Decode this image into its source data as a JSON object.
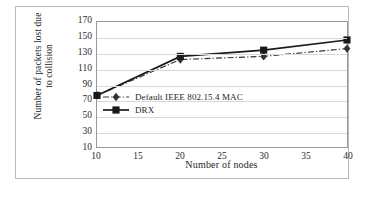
{
  "chart_data": {
    "type": "line",
    "title": "",
    "xlabel": "Number of nodes",
    "ylabel": "Number of packets lost due\nto collision",
    "x": [
      10,
      20,
      30,
      40
    ],
    "xlim": [
      10,
      40
    ],
    "ylim": [
      10,
      170
    ],
    "xticks": [
      10,
      15,
      20,
      25,
      30,
      35,
      40
    ],
    "yticks": [
      10,
      30,
      50,
      70,
      90,
      110,
      130,
      150,
      170
    ],
    "grid": true,
    "legend_position": "center",
    "series": [
      {
        "name": "Default IEEE 802.15.4 MAC",
        "values": [
          76,
          122,
          126,
          136
        ],
        "marker": "diamond",
        "line_style": "dash-dot",
        "color": "#333333"
      },
      {
        "name": "DRX",
        "values": [
          76,
          126,
          134,
          147
        ],
        "marker": "square",
        "line_style": "solid",
        "color": "#1a1a1a"
      }
    ]
  },
  "axes": {
    "x_title": "Number of nodes",
    "y_title_line1": "Number of packets lost due",
    "y_title_line2": "to collision",
    "x_tick_labels": [
      "10",
      "15",
      "20",
      "25",
      "30",
      "35",
      "40"
    ],
    "y_tick_labels": [
      "170",
      "150",
      "130",
      "110",
      "90",
      "70",
      "50",
      "30",
      "10"
    ]
  },
  "legend": {
    "entries": [
      {
        "label": "Default IEEE 802.15.4 MAC"
      },
      {
        "label": "DRX"
      }
    ]
  },
  "colors": {
    "frame": "#b9b9b9",
    "plot_border": "#9a9a9a",
    "gridline": "#d7d7d7",
    "series_default": "#333333",
    "series_drx": "#1a1a1a",
    "background": "#ffffff"
  }
}
